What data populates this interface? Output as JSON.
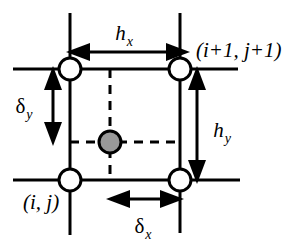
{
  "figure": {
    "type": "diagram",
    "background_color": "#ffffff",
    "line_color": "#000000",
    "node_fill_color": "#ffffff",
    "interior_point_fill_color": "#999999"
  },
  "labels": {
    "cell_width": {
      "symbol": "h",
      "subscript": "x",
      "text": "hx"
    },
    "cell_height": {
      "symbol": "h",
      "subscript": "y",
      "text": "hy"
    },
    "offset_x": {
      "symbol": "δ",
      "subscript": "x",
      "text": "δx"
    },
    "offset_y": {
      "symbol": "δ",
      "subscript": "y",
      "text": "δy"
    },
    "node_lower_left": "(i, j)",
    "node_upper_right": "(i+1, j+1)"
  },
  "nodes": [
    {
      "name": "node-upper-left",
      "x": 70,
      "y": 69
    },
    {
      "name": "node-upper-right",
      "x": 180,
      "y": 69
    },
    {
      "name": "node-lower-left",
      "x": 70,
      "y": 180
    },
    {
      "name": "node-lower-right",
      "x": 180,
      "y": 180
    }
  ],
  "interior_point": {
    "name": "interior-point",
    "x": 110,
    "y": 142,
    "radius": 11
  },
  "dimensions": {
    "hx_arrow": {
      "x1": 68,
      "y1": 52,
      "x2": 188,
      "y2": 52,
      "orientation": "horizontal"
    },
    "hy_arrow": {
      "x1": 197,
      "y1": 69,
      "x2": 197,
      "y2": 180,
      "orientation": "vertical"
    },
    "delta_x_arrow": {
      "x1": 110,
      "y1": 199,
      "x2": 180,
      "y2": 199,
      "orientation": "horizontal"
    },
    "delta_y_arrow": {
      "x1": 53,
      "y1": 69,
      "x2": 53,
      "y2": 142,
      "orientation": "vertical"
    }
  },
  "grid_lines": {
    "vertical_left": {
      "x": 70,
      "y1": 13,
      "y2": 235
    },
    "vertical_right": {
      "x": 180,
      "y1": 13,
      "y2": 233
    },
    "horizontal_top": {
      "y": 69,
      "x1": 13,
      "x2": 238
    },
    "horizontal_bottom": {
      "y": 180,
      "x1": 13,
      "x2": 240
    }
  },
  "dashed_lines": {
    "vertical": {
      "x": 110,
      "y1": 69,
      "y2": 180
    },
    "horizontal": {
      "y": 142,
      "x1": 70,
      "x2": 180
    }
  }
}
